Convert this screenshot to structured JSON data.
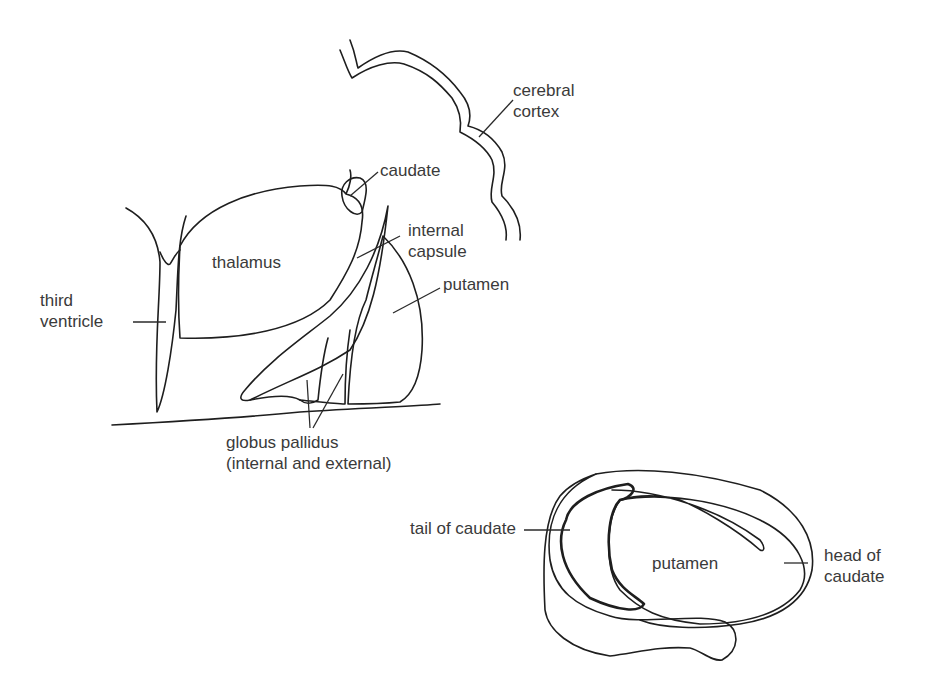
{
  "diagram": {
    "top_view": {
      "labels": {
        "cerebral_cortex": "cerebral\ncortex",
        "caudate": "caudate",
        "internal_capsule": "internal\ncapsule",
        "thalamus": "thalamus",
        "putamen": "putamen",
        "third_ventricle": "third\nventricle",
        "globus_pallidus": "globus pallidus\n(internal and external)"
      }
    },
    "bottom_view": {
      "labels": {
        "tail_of_caudate": "tail of caudate",
        "putamen": "putamen",
        "head_of_caudate": "head of\ncaudate"
      }
    },
    "colors": {
      "line": "#1e1e1e",
      "text": "#3a3a3a",
      "background": "#ffffff"
    }
  }
}
